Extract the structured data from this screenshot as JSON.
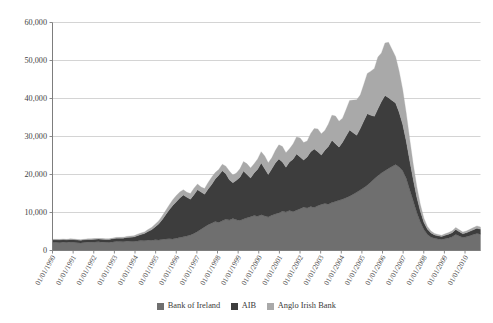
{
  "chart_data": {
    "type": "area",
    "stacked": true,
    "title": "",
    "subtitle": "",
    "xlabel": "",
    "ylabel": "",
    "ylim": [
      0,
      60000
    ],
    "ytick_labels": [
      "0",
      "10,000",
      "20,000",
      "30,000",
      "40,000",
      "50,000",
      "60,000"
    ],
    "ytick_values": [
      0,
      10000,
      20000,
      30000,
      40000,
      50000,
      60000
    ],
    "grid": true,
    "legend_position": "bottom",
    "xtick_labels": [
      "01/01/1990",
      "01/01/1991",
      "01/01/1992",
      "01/01/1993",
      "01/01/1994",
      "01/01/1995",
      "01/01/1996",
      "01/01/1997",
      "01/01/1998",
      "01/01/1999",
      "01/01/2000",
      "01/01/2001",
      "01/01/2002",
      "01/01/2003",
      "01/01/2004",
      "01/01/2005",
      "01/01/2006",
      "01/01/2007",
      "01/01/2008",
      "01/01/2009",
      "01/01/2010"
    ],
    "xlim": [
      1990.0,
      2010.75
    ],
    "colors": {
      "bank_of_ireland": "#6f6f6f",
      "aib": "#3d3d3d",
      "anglo_irish_bank": "#a9a9a9",
      "gridline": "#c9c9c9",
      "axis": "#7d7d7d"
    },
    "series": [
      {
        "name": "Bank of Ireland",
        "color": "#6f6f6f",
        "values": [
          2100,
          2150,
          2050,
          2200,
          2100,
          2250,
          2150,
          2050,
          2000,
          2100,
          2200,
          2150,
          2250,
          2300,
          2200,
          2150,
          2100,
          2250,
          2400,
          2350,
          2300,
          2450,
          2400,
          2350,
          2500,
          2600,
          2550,
          2700,
          2650,
          2800,
          2750,
          2900,
          3000,
          3100,
          3050,
          3200,
          3400,
          3600,
          3800,
          4100,
          4500,
          5000,
          5600,
          6200,
          6800,
          7200,
          7600,
          7400,
          7800,
          8200,
          8000,
          8400,
          8100,
          7900,
          8300,
          8600,
          8900,
          9200,
          9000,
          9400,
          9100,
          8800,
          9300,
          9600,
          9900,
          10300,
          10100,
          10500,
          10200,
          10600,
          11000,
          11400,
          11200,
          11600,
          11300,
          11800,
          12100,
          12400,
          12200,
          12600,
          12900,
          13200,
          13500,
          13900,
          14300,
          14800,
          15300,
          15900,
          16500,
          17200,
          18000,
          18900,
          19700,
          20400,
          21000,
          21600,
          22100,
          22600,
          22000,
          21000,
          19000,
          16000,
          13000,
          10000,
          7500,
          5500,
          4200,
          3500,
          3200,
          3000,
          2900,
          3100,
          3300,
          3600,
          4200,
          3800,
          3400,
          3600,
          3900,
          4200,
          4500,
          4300
        ]
      },
      {
        "name": "AIB",
        "color": "#3d3d3d",
        "values": [
          700,
          650,
          720,
          680,
          700,
          660,
          740,
          700,
          680,
          720,
          700,
          760,
          740,
          700,
          780,
          760,
          800,
          820,
          850,
          900,
          950,
          1000,
          1100,
          1200,
          1400,
          1600,
          1900,
          2300,
          2800,
          3400,
          4200,
          5200,
          6400,
          7600,
          8800,
          9600,
          10400,
          11000,
          10200,
          9400,
          10200,
          11000,
          9800,
          8600,
          9400,
          10200,
          11200,
          12400,
          13200,
          12000,
          10600,
          9400,
          10400,
          11400,
          12600,
          11400,
          10200,
          11200,
          12400,
          13600,
          12400,
          11200,
          12200,
          13400,
          14200,
          13000,
          11800,
          12800,
          13800,
          14800,
          13600,
          12400,
          13400,
          14400,
          15400,
          14200,
          13000,
          14000,
          15200,
          16400,
          15200,
          14000,
          15000,
          16200,
          17400,
          16200,
          15000,
          16200,
          17600,
          18800,
          17600,
          16400,
          17600,
          18800,
          19800,
          18600,
          17400,
          16200,
          14400,
          12200,
          9800,
          7600,
          5600,
          4000,
          2800,
          1900,
          1400,
          1100,
          900,
          850,
          800,
          900,
          1000,
          1100,
          1300,
          1150,
          1000,
          1050,
          1150,
          1250,
          1350,
          1300
        ]
      },
      {
        "name": "Anglo Irish Bank",
        "color": "#a9a9a9",
        "values": [
          150,
          140,
          160,
          150,
          145,
          155,
          150,
          160,
          155,
          150,
          165,
          160,
          155,
          170,
          165,
          175,
          180,
          190,
          200,
          220,
          240,
          260,
          290,
          320,
          360,
          400,
          450,
          520,
          600,
          700,
          820,
          960,
          1100,
          1300,
          1500,
          1700,
          1600,
          1400,
          1300,
          1500,
          1700,
          1500,
          1300,
          1500,
          1700,
          1900,
          1700,
          1500,
          1700,
          2000,
          2300,
          2100,
          1900,
          2200,
          2500,
          2800,
          2600,
          2400,
          2700,
          3000,
          3400,
          3100,
          2900,
          3300,
          3700,
          4100,
          3800,
          3500,
          4000,
          4500,
          5000,
          4600,
          4200,
          4800,
          5400,
          6000,
          5600,
          5200,
          5900,
          6600,
          7300,
          6800,
          6300,
          7000,
          7800,
          8600,
          9400,
          8800,
          9600,
          10600,
          11600,
          12600,
          13600,
          12800,
          13800,
          14600,
          13400,
          12200,
          10800,
          9200,
          7400,
          5600,
          4000,
          2800,
          1800,
          1100,
          700,
          500,
          400,
          350,
          320,
          380,
          420,
          480,
          560,
          500,
          440,
          470,
          520,
          580,
          620,
          600
        ]
      }
    ]
  },
  "legend": {
    "items": [
      {
        "label": "Bank of Ireland",
        "color": "#6f6f6f"
      },
      {
        "label": "AIB",
        "color": "#3d3d3d"
      },
      {
        "label": "Anglo Irish Bank",
        "color": "#a9a9a9"
      }
    ]
  }
}
